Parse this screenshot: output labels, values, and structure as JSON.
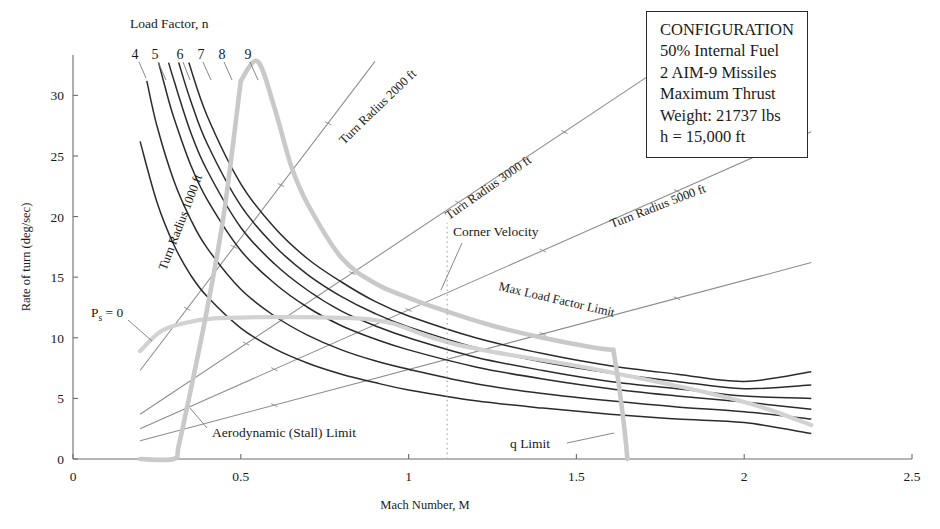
{
  "chart_data": {
    "type": "line",
    "title": "",
    "xlabel": "Mach Number, M",
    "ylabel": "Rate of turn (deg/sec)",
    "xlim": [
      0,
      2.5
    ],
    "ylim": [
      0,
      33
    ],
    "grid": false,
    "legend": "none",
    "xticks": [
      0,
      0.5,
      1,
      1.5,
      2,
      2.5
    ],
    "xticklabels": [
      "0",
      "0.5",
      "1",
      "1.5",
      "2",
      "2.5"
    ],
    "yticks": [
      0,
      5,
      10,
      15,
      20,
      25,
      30
    ],
    "yticklabels": [
      "0",
      "5",
      "10",
      "15",
      "20",
      "25",
      "30"
    ],
    "series": [
      {
        "name": "n = 4",
        "kind": "load-factor",
        "x": [
          0.2,
          0.25,
          0.3,
          0.35,
          0.4,
          0.5,
          0.6,
          0.7,
          0.8,
          0.9,
          1.0,
          1.2,
          1.4,
          1.6,
          1.8,
          2.0,
          2.2
        ],
        "y": [
          26.2,
          21.2,
          17.7,
          15.2,
          13.4,
          10.8,
          9.1,
          7.9,
          7.0,
          6.3,
          5.7,
          4.8,
          4.2,
          3.7,
          3.3,
          3.0,
          2.1
        ]
      },
      {
        "name": "n = 5",
        "kind": "load-factor",
        "x": [
          0.22,
          0.25,
          0.3,
          0.35,
          0.4,
          0.5,
          0.6,
          0.7,
          0.8,
          0.9,
          1.0,
          1.2,
          1.4,
          1.6,
          1.8,
          2.0,
          2.2
        ],
        "y": [
          31.2,
          27.5,
          23.0,
          19.8,
          17.4,
          14.0,
          11.8,
          10.2,
          9.0,
          8.1,
          7.4,
          6.2,
          5.4,
          4.8,
          4.3,
          3.9,
          3.3
        ]
      },
      {
        "name": "n = 6",
        "kind": "load-factor",
        "x": [
          0.255,
          0.28,
          0.3,
          0.35,
          0.4,
          0.5,
          0.6,
          0.7,
          0.8,
          0.9,
          1.0,
          1.2,
          1.4,
          1.6,
          1.8,
          2.0,
          2.2
        ],
        "y": [
          32.7,
          30.1,
          28.2,
          24.3,
          21.4,
          17.2,
          14.5,
          12.5,
          11.0,
          9.9,
          9.0,
          7.6,
          6.6,
          5.8,
          5.2,
          4.7,
          4.1
        ]
      },
      {
        "name": "n = 7",
        "kind": "load-factor",
        "x": [
          0.285,
          0.3,
          0.35,
          0.4,
          0.5,
          0.6,
          0.7,
          0.8,
          0.9,
          1.0,
          1.2,
          1.4,
          1.6,
          1.8,
          2.0,
          2.2
        ],
        "y": [
          32.7,
          31.3,
          27.0,
          23.8,
          19.1,
          16.1,
          13.9,
          12.2,
          11.0,
          10.0,
          8.4,
          7.3,
          6.4,
          5.8,
          5.2,
          5.0
        ]
      },
      {
        "name": "n = 8",
        "kind": "load-factor",
        "x": [
          0.315,
          0.35,
          0.4,
          0.5,
          0.6,
          0.7,
          0.8,
          0.9,
          1.0,
          1.2,
          1.4,
          1.6,
          1.8,
          2.0,
          2.2
        ],
        "y": [
          32.7,
          29.6,
          26.0,
          20.9,
          17.6,
          15.2,
          13.4,
          12.0,
          10.9,
          9.2,
          8.0,
          7.1,
          6.4,
          5.8,
          6.1
        ]
      },
      {
        "name": "n = 9",
        "kind": "load-factor",
        "x": [
          0.345,
          0.4,
          0.5,
          0.6,
          0.7,
          0.8,
          0.9,
          1.0,
          1.2,
          1.4,
          1.6,
          1.8,
          2.0,
          2.2
        ],
        "y": [
          32.7,
          28.3,
          22.7,
          19.1,
          16.5,
          14.6,
          13.0,
          11.8,
          10.0,
          8.7,
          7.7,
          7.0,
          6.4,
          7.2
        ]
      },
      {
        "name": "Turn Radius 1000 ft",
        "kind": "turn-radius",
        "radius_ft": 1000,
        "x": [
          0.2,
          0.9
        ],
        "y": [
          7.3,
          32.8
        ]
      },
      {
        "name": "Turn Radius 2000 ft",
        "kind": "turn-radius",
        "radius_ft": 2000,
        "x": [
          0.2,
          1.78
        ],
        "y": [
          3.7,
          32.8
        ]
      },
      {
        "name": "Turn Radius 3000 ft",
        "kind": "turn-radius",
        "radius_ft": 3000,
        "x": [
          0.2,
          2.2
        ],
        "y": [
          2.5,
          27.0
        ]
      },
      {
        "name": "Turn Radius 5000 ft",
        "kind": "turn-radius",
        "radius_ft": 5000,
        "x": [
          0.2,
          2.2
        ],
        "y": [
          1.5,
          16.2
        ]
      },
      {
        "name": "Ps = 0",
        "kind": "specific-excess-power",
        "x": [
          0.2,
          0.26,
          0.33,
          0.42,
          0.55,
          0.7,
          0.85,
          0.95,
          1.05,
          1.15,
          1.3,
          1.5,
          1.7,
          1.9,
          2.05,
          2.2
        ],
        "y": [
          8.9,
          10.5,
          11.2,
          11.6,
          11.7,
          11.7,
          11.6,
          11.2,
          10.2,
          9.4,
          8.6,
          7.7,
          6.6,
          5.4,
          4.3,
          2.8
        ]
      },
      {
        "name": "Aerodynamic (Stall) Limit",
        "kind": "envelope-stall",
        "x": [
          0.2,
          0.3,
          0.315,
          0.35,
          0.4,
          0.45,
          0.5
        ],
        "y": [
          0.0,
          0.0,
          1.1,
          5.6,
          12.4,
          20.3,
          31.2
        ]
      },
      {
        "name": "Max Load Factor Limit",
        "kind": "envelope-maxn",
        "x": [
          0.5,
          0.55,
          0.6,
          0.65,
          0.7,
          0.8,
          0.9,
          1.0,
          1.1,
          1.25,
          1.4,
          1.55,
          1.61
        ],
        "y": [
          31.2,
          32.8,
          29.0,
          24.2,
          21.0,
          16.6,
          14.5,
          13.3,
          12.3,
          11.0,
          10.0,
          9.2,
          9.0
        ]
      },
      {
        "name": "q Limit",
        "kind": "envelope-q",
        "x": [
          1.61,
          1.625,
          1.64,
          1.648,
          1.652
        ],
        "y": [
          9.0,
          6.4,
          3.2,
          1.2,
          0.0
        ]
      },
      {
        "name": "Corner Velocity marker",
        "kind": "reference-line",
        "x": 1.115
      }
    ],
    "annotations": [
      {
        "id": "load-factor-title",
        "text": "Load Factor, n"
      },
      {
        "id": "n-4",
        "text": "4"
      },
      {
        "id": "n-5",
        "text": "5"
      },
      {
        "id": "n-6",
        "text": "6"
      },
      {
        "id": "n-7",
        "text": "7"
      },
      {
        "id": "n-8",
        "text": "8"
      },
      {
        "id": "n-9",
        "text": "9"
      },
      {
        "id": "tr-1000",
        "text": "Turn Radius 1000 ft"
      },
      {
        "id": "tr-2000",
        "text": "Turn Radius 2000 ft"
      },
      {
        "id": "tr-3000",
        "text": "Turn Radius 3000 ft"
      },
      {
        "id": "tr-5000",
        "text": "Turn Radius 5000 ft"
      },
      {
        "id": "ps-zero",
        "text": "P",
        "sub": "s",
        "tail": " = 0"
      },
      {
        "id": "corner-velocity",
        "text": "Corner Velocity"
      },
      {
        "id": "max-load-factor",
        "text": "Max Load Factor Limit"
      },
      {
        "id": "stall-limit",
        "text": "Aerodynamic (Stall) Limit"
      },
      {
        "id": "q-limit",
        "text": "q Limit"
      }
    ]
  },
  "config_box": {
    "title": "CONFIGURATION",
    "lines": [
      "50% Internal Fuel",
      "2 AIM-9 Missiles",
      "Maximum Thrust",
      "Weight: 21737 lbs",
      "h = 15,000 ft"
    ]
  },
  "colors": {
    "load_factor_curve": "#2b2b2b",
    "turn_radius_line": "#8c8c8c",
    "envelope": "#c9c9c9",
    "ps_curve": "#d2d2d2",
    "axis": "#6d6d6d",
    "dotted_reference": "#c2a9a9",
    "text": "#1a1a1a"
  }
}
